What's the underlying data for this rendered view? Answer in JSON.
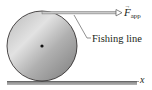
{
  "diagram": {
    "force_label": {
      "symbol": "F",
      "subscript": "app",
      "vector_arrow": "→"
    },
    "fishing_line_label": "Fishing line",
    "axis_label": "x",
    "colors": {
      "cylinder_light": "#dcdcdc",
      "cylinder_dark": "#8a8a8a",
      "outline": "#231f20",
      "ground": "#9a9a9a",
      "line": "#6e6e6e"
    }
  }
}
